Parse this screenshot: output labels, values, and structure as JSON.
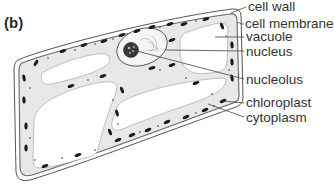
{
  "figure": {
    "panel_label": "(b)",
    "colors": {
      "background": "#ffffff",
      "outline": "#555555",
      "cytoplasm_fill": "#e8e8e8",
      "vacuole_fill": "#ffffff",
      "chloroplast_fill": "#1a1a1a",
      "label_text": "#333333",
      "leader_line": "#444444"
    },
    "labels": [
      {
        "id": "cell-wall",
        "text": "cell wall"
      },
      {
        "id": "cell-membrane",
        "text": "cell membrane"
      },
      {
        "id": "vacuole",
        "text": "vacuole"
      },
      {
        "id": "nucleus",
        "text": "nucleus"
      },
      {
        "id": "nucleolus",
        "text": "nucleolus"
      },
      {
        "id": "chloroplast",
        "text": "chloroplast"
      },
      {
        "id": "cytoplasm",
        "text": "cytoplasm"
      }
    ]
  }
}
